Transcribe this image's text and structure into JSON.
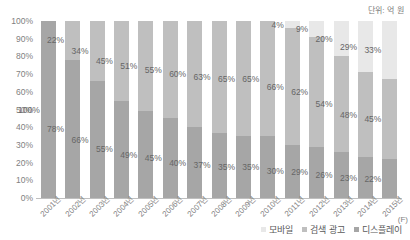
{
  "unit_caption": "단위: 억 원",
  "y_axis": {
    "ticks": [
      "100%",
      "90%",
      "80%",
      "70%",
      "60%",
      "50%",
      "40%",
      "30%",
      "20%",
      "10%",
      "0%"
    ]
  },
  "x_axis": {
    "suffix": "(F)"
  },
  "legend": {
    "items": [
      {
        "label": "모바일",
        "color": "#e8e8e8",
        "key": "mobile"
      },
      {
        "label": "검색 광고",
        "color": "#bfbfbf",
        "key": "search"
      },
      {
        "label": "디스플레이",
        "color": "#a6a6a6",
        "key": "display"
      }
    ]
  },
  "chart_data": {
    "type": "bar",
    "subtype": "100% stacked column",
    "title": "",
    "subtitle": "",
    "xlabel": "",
    "ylabel": "",
    "unit": "단위: 억 원",
    "ylim": [
      0,
      100
    ],
    "y_ticks": [
      0,
      10,
      20,
      30,
      40,
      50,
      60,
      70,
      80,
      90,
      100
    ],
    "y_tick_labels": [
      "0%",
      "10%",
      "20%",
      "30%",
      "40%",
      "50%",
      "60%",
      "70%",
      "80%",
      "90%",
      "100%"
    ],
    "grid": false,
    "legend_position": "bottom-right",
    "categories": [
      "2001년",
      "2002년",
      "2003년",
      "2004년",
      "2005년",
      "2006년",
      "2007년",
      "2008년",
      "2009년",
      "2010년",
      "2011년",
      "2012년",
      "2013년",
      "2014년",
      "2015년"
    ],
    "series": [
      {
        "name": "디스플레이",
        "color": "#a6a6a6",
        "stack_order": 0,
        "values": [
          100,
          78,
          66,
          55,
          49,
          45,
          40,
          37,
          35,
          35,
          30,
          29,
          26,
          23,
          22
        ],
        "labels": [
          "100%",
          "78%",
          "66%",
          "55%",
          "49%",
          "45%",
          "40%",
          "37%",
          "35%",
          "35%",
          "30%",
          "29%",
          "26%",
          "23%",
          "22%"
        ]
      },
      {
        "name": "검색 광고",
        "color": "#bfbfbf",
        "stack_order": 1,
        "values": [
          0,
          22,
          34,
          45,
          51,
          55,
          60,
          63,
          65,
          65,
          66,
          62,
          54,
          48,
          45
        ],
        "labels": [
          "",
          "22%",
          "34%",
          "45%",
          "51%",
          "55%",
          "60%",
          "63%",
          "65%",
          "65%",
          "66%",
          "62%",
          "54%",
          "48%",
          "45%"
        ]
      },
      {
        "name": "모바일",
        "color": "#e8e8e8",
        "stack_order": 2,
        "values": [
          0,
          0,
          0,
          0,
          0,
          0,
          0,
          0,
          0,
          0,
          4,
          9,
          20,
          29,
          33
        ],
        "labels": [
          "",
          "",
          "",
          "",
          "",
          "",
          "",
          "",
          "",
          "",
          "4%",
          "9%",
          "20%",
          "29%",
          "33%"
        ]
      }
    ]
  }
}
